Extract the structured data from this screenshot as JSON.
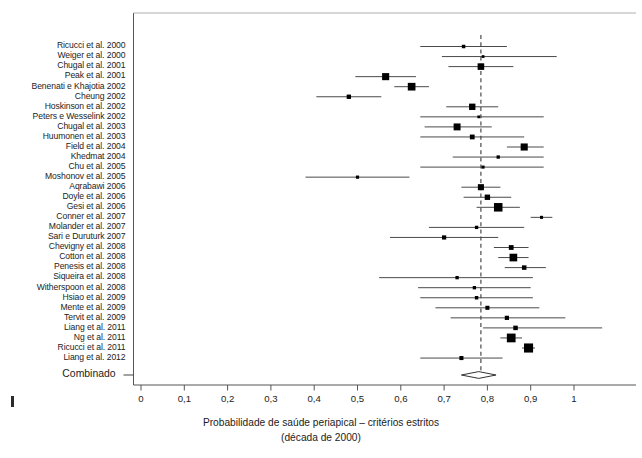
{
  "axis": {
    "caption_line1": "Probabilidade de saúde periapical – critérios estritos",
    "caption_line2": "(década de 2000)",
    "tick_labels": [
      "0",
      "0,1",
      "0,2",
      "0,3",
      "0,4",
      "0,5",
      "0,6",
      "0,7",
      "0,8",
      "0,9",
      "1"
    ],
    "tick_values": [
      0,
      0.1,
      0.2,
      0.3,
      0.4,
      0.5,
      0.6,
      0.7,
      0.8,
      0.9,
      1.0
    ]
  },
  "summary_label": "Combinado",
  "chart_data": {
    "type": "forest",
    "title": "",
    "xlabel": "Probabilidade de saúde periapical – critérios estritos (década de 2000)",
    "ylabel": "",
    "xlim": [
      0,
      1.07
    ],
    "grid": false,
    "legend": "none",
    "reference_line": 0.785,
    "categories": [
      "Ricucci et al. 2000",
      "Weiger et al. 2000",
      "Chugal et al. 2001",
      "Peak et al. 2001",
      "Benenati e Khajotia 2002",
      "Cheung 2002",
      "Hoskinson et al. 2002",
      "Peters e Wesselink 2002",
      "Chugal et al. 2003",
      "Huumonen et al. 2003",
      "Field et al. 2004",
      "Khedmat 2004",
      "Chu et al. 2005",
      "Moshonov et al. 2005",
      "Aqrabawi 2006",
      "Doyle et al. 2006",
      "Gesi et al. 2006",
      "Conner et al. 2007",
      "Molander et al. 2007",
      "Sari e Duruturk 2007",
      "Chevigny et al. 2008",
      "Cotton et al. 2008",
      "Penesis et al. 2008",
      "Siqueira et al. 2008",
      "Witherspoon et al. 2008",
      "Hsiao et al. 2009",
      "Mente et al. 2009",
      "Tervit et al. 2009",
      "Liang et al. 2011",
      "Ng et al. 2011",
      "Ricucci et al. 2011",
      "Liang et al. 2012"
    ],
    "estimates": [
      0.745,
      0.79,
      0.785,
      0.565,
      0.625,
      0.48,
      0.765,
      0.78,
      0.73,
      0.765,
      0.885,
      0.825,
      0.79,
      0.5,
      0.785,
      0.8,
      0.825,
      0.925,
      0.775,
      0.7,
      0.855,
      0.86,
      0.885,
      0.73,
      0.77,
      0.775,
      0.8,
      0.845,
      0.865,
      0.855,
      0.895,
      0.74
    ],
    "ci_lower": [
      0.645,
      0.695,
      0.71,
      0.495,
      0.585,
      0.405,
      0.705,
      0.645,
      0.655,
      0.645,
      0.845,
      0.72,
      0.645,
      0.38,
      0.74,
      0.745,
      0.775,
      0.9,
      0.665,
      0.575,
      0.815,
      0.825,
      0.84,
      0.55,
      0.64,
      0.645,
      0.68,
      0.715,
      0.79,
      0.83,
      0.88,
      0.645
    ],
    "ci_upper": [
      0.845,
      0.96,
      0.86,
      0.635,
      0.665,
      0.555,
      0.825,
      0.93,
      0.81,
      0.885,
      0.93,
      0.93,
      0.93,
      0.62,
      0.83,
      0.855,
      0.875,
      0.95,
      0.885,
      0.825,
      0.895,
      0.895,
      0.935,
      0.905,
      0.9,
      0.905,
      0.92,
      0.98,
      1.065,
      0.88,
      0.91,
      0.835
    ],
    "marker_weights": [
      0.22,
      0.12,
      0.65,
      0.72,
      0.8,
      0.34,
      0.62,
      0.12,
      0.7,
      0.4,
      0.72,
      0.2,
      0.16,
      0.18,
      0.58,
      0.48,
      0.92,
      0.16,
      0.2,
      0.32,
      0.4,
      0.8,
      0.36,
      0.2,
      0.2,
      0.22,
      0.3,
      0.32,
      0.36,
      0.95,
      1.0,
      0.3
    ],
    "summary": {
      "label": "Combinado",
      "estimate": 0.78,
      "ci_lower": 0.74,
      "ci_upper": 0.82
    }
  }
}
